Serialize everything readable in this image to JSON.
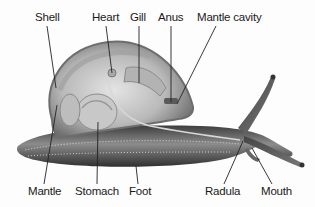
{
  "diagram": {
    "labels": [
      {
        "id": "shell",
        "text": "Shell",
        "x": 35,
        "y": 12,
        "line": [
          47,
          26,
          56,
          88
        ]
      },
      {
        "id": "heart",
        "text": "Heart",
        "x": 92,
        "y": 12,
        "line": [
          106,
          26,
          112,
          73
        ]
      },
      {
        "id": "gill",
        "text": "Gill",
        "x": 130,
        "y": 12,
        "line": [
          139,
          26,
          139,
          83
        ]
      },
      {
        "id": "anus",
        "text": "Anus",
        "x": 158,
        "y": 12,
        "line": [
          171,
          26,
          171,
          102
        ]
      },
      {
        "id": "mantle-cavity",
        "text": "Mantle cavity",
        "x": 197,
        "y": 12,
        "line": [
          216,
          26,
          177,
          104
        ]
      },
      {
        "id": "mantle",
        "text": "Mantle",
        "x": 28,
        "y": 186,
        "line": [
          44,
          184,
          57,
          105
        ]
      },
      {
        "id": "stomach",
        "text": "Stomach",
        "x": 75,
        "y": 186,
        "line": [
          97,
          184,
          98,
          122
        ]
      },
      {
        "id": "foot",
        "text": "Foot",
        "x": 129,
        "y": 186,
        "line": [
          138,
          184,
          136,
          166
        ]
      },
      {
        "id": "radula",
        "text": "Radula",
        "x": 205,
        "y": 186,
        "line": [
          224,
          184,
          243,
          141
        ]
      },
      {
        "id": "mouth",
        "text": "Mouth",
        "x": 261,
        "y": 186,
        "line": [
          272,
          184,
          252,
          148
        ]
      }
    ]
  },
  "colors": {
    "label_text": "#1a1a1a",
    "leader_line": "#222222",
    "shell_outer": "#8a8a8a",
    "body_dark": "#4a4a4a",
    "body_mid": "#9a9a9a",
    "organ_light": "#cfcfcf"
  }
}
